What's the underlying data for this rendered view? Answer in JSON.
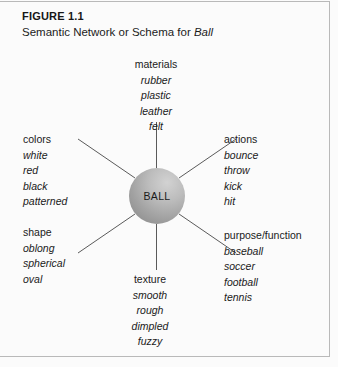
{
  "figure": {
    "number": "FIGURE 1.1",
    "title_prefix": "Semantic Network or Schema for ",
    "title_italic": "Ball"
  },
  "center_node": {
    "label": "BALL"
  },
  "clusters": [
    {
      "id": "materials",
      "head": "materials",
      "items": [
        "rubber",
        "plastic",
        "leather",
        "felt"
      ]
    },
    {
      "id": "colors",
      "head": "colors",
      "items": [
        "white",
        "red",
        "black",
        "patterned"
      ]
    },
    {
      "id": "shape",
      "head": "shape",
      "items": [
        "oblong",
        "spherical",
        "oval"
      ]
    },
    {
      "id": "actions",
      "head": "actions",
      "items": [
        "bounce",
        "throw",
        "kick",
        "hit"
      ]
    },
    {
      "id": "purpose",
      "head": "purpose/function",
      "items": [
        "baseball",
        "soccer",
        "football",
        "tennis"
      ]
    },
    {
      "id": "texture",
      "head": "texture",
      "items": [
        "smooth",
        "rough",
        "dimpled",
        "fuzzy"
      ]
    }
  ],
  "colors": {
    "line": "#5a5a5a",
    "frame": "#b9b9b9",
    "text": "#1a1a1a",
    "background": "#fbfbfb"
  }
}
